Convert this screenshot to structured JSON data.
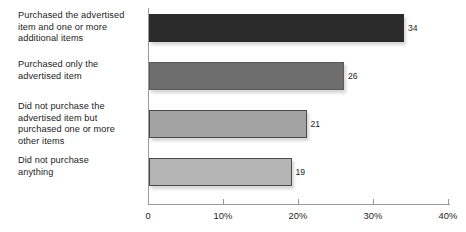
{
  "chart_data": {
    "type": "bar",
    "orientation": "horizontal",
    "title": "",
    "xlabel": "",
    "ylabel": "",
    "xlim": [
      0,
      40
    ],
    "grid": false,
    "legend": false,
    "categories": [
      "Purchased the advertised\nitem and one or more\nadditional items",
      "Purchased only the\nadvertised item",
      "Did not purchase the\nadvertised item but\npurchased one or more\nother items",
      "Did not purchase\nanything"
    ],
    "values": [
      34,
      26,
      21,
      19
    ],
    "value_labels": [
      "34",
      "26",
      "21",
      "19"
    ],
    "bar_colors": [
      "#2b2b2b",
      "#6e6e6e",
      "#a3a3a3",
      "#b4b4b4"
    ],
    "bar_border_colors": [
      "#2b2b2b",
      "#5a5a5a",
      "#4a4a4a",
      "#4a4a4a"
    ],
    "xticks": [
      0,
      10,
      20,
      30,
      40
    ],
    "xticklabels": [
      "0",
      "10%",
      "20%",
      "30%",
      "40%"
    ],
    "axis_color": "#9a9a9a",
    "background": "#ffffff"
  }
}
